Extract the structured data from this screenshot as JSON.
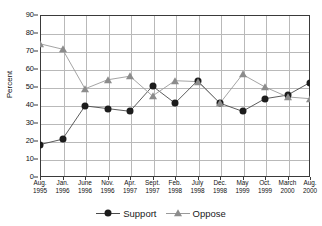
{
  "chart_data": {
    "type": "line",
    "title": "",
    "xlabel": "",
    "ylabel": "Percent",
    "ylim": [
      0,
      90
    ],
    "ytick_step": 10,
    "yticks": [
      0,
      10,
      20,
      30,
      40,
      50,
      60,
      70,
      80,
      90
    ],
    "grid": true,
    "legend_position": "bottom-center",
    "categories": [
      "Aug. 1995",
      "Jan. 1996",
      "June 1996",
      "Nov. 1996",
      "Apr. 1997",
      "Sept. 1997",
      "Feb. 1998",
      "July 1998",
      "Dec. 1998",
      "May 1999",
      "Oct. 1999",
      "March 2000",
      "Aug. 2000"
    ],
    "category_lines": [
      [
        "Aug.",
        "1995"
      ],
      [
        "Jan.",
        "1996"
      ],
      [
        "June",
        "1996"
      ],
      [
        "Nov.",
        "1996"
      ],
      [
        "Apr.",
        "1997"
      ],
      [
        "Sept.",
        "1997"
      ],
      [
        "Feb.",
        "1998"
      ],
      [
        "July",
        "1998"
      ],
      [
        "Dec.",
        "1998"
      ],
      [
        "May",
        "1999"
      ],
      [
        "Oct.",
        "1999"
      ],
      [
        "March",
        "2000"
      ],
      [
        "Aug.",
        "2000"
      ]
    ],
    "series": [
      {
        "name": "Support",
        "marker": "circle",
        "color": "#1c1c1c",
        "line_color": "#4a4a4a",
        "values": [
          18,
          21,
          39.5,
          38,
          36.5,
          50.5,
          41,
          53.5,
          41,
          36.5,
          43.5,
          45.5,
          52.5
        ]
      },
      {
        "name": "Oppose",
        "marker": "triangle",
        "color": "#8c8c8c",
        "line_color": "#9a9a9a",
        "values": [
          74,
          71,
          49,
          54,
          56,
          45,
          53.5,
          53,
          41,
          57,
          50,
          44.5,
          43.5
        ]
      }
    ]
  },
  "legend": {
    "items": [
      {
        "label": "Support",
        "marker": "circle"
      },
      {
        "label": "Oppose",
        "marker": "triangle"
      }
    ]
  }
}
